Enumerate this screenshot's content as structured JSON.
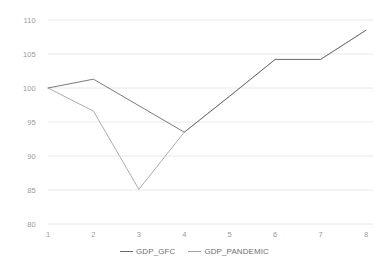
{
  "chart_data": {
    "type": "line",
    "title": "",
    "xlabel": "",
    "ylabel": "",
    "x": [
      1,
      2,
      3,
      4,
      5,
      6,
      7,
      8
    ],
    "xtick_labels": [
      "1",
      "2",
      "3",
      "4",
      "5",
      "6",
      "7",
      "8"
    ],
    "ytick_labels": [
      "110",
      "105",
      "100",
      "95",
      "90",
      "85",
      "80"
    ],
    "ytick_values": [
      110,
      105,
      100,
      95,
      90,
      85,
      80
    ],
    "ylim": [
      80,
      110
    ],
    "xlim": [
      1,
      8
    ],
    "grid": "horizontal",
    "legend_position": "bottom-center",
    "series": [
      {
        "name": "GDP_GFC",
        "color": "#6b6b6b",
        "values": [
          100.0,
          101.3,
          97.4,
          93.5,
          98.8,
          104.2,
          104.2,
          108.5
        ]
      },
      {
        "name": "GDP_PANDEMIC",
        "color": "#a3a3a3",
        "values": [
          100.0,
          96.6,
          85.1,
          93.5,
          98.8,
          104.2,
          104.2,
          108.5
        ]
      }
    ]
  },
  "legend": {
    "items": [
      {
        "label": "GDP_GFC",
        "color": "#6b6b6b"
      },
      {
        "label": "GDP_PANDEMIC",
        "color": "#a3a3a3"
      }
    ]
  },
  "colors": {
    "gridline": "#e8e8e8",
    "tick_text": "#9a9a9a",
    "legend_text": "#6f6f6f",
    "background": "#ffffff"
  }
}
